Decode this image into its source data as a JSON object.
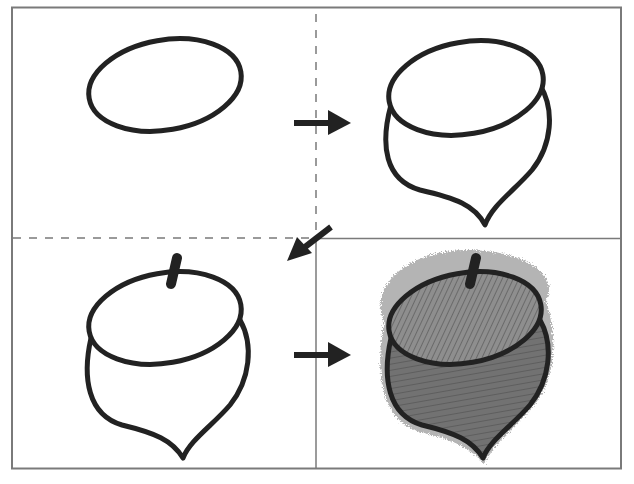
{
  "diagram": {
    "title": "How to draw an acorn",
    "layout": "2x2 grid",
    "colors": {
      "stroke": "#222222",
      "frame": "#7a7a7a",
      "cap_fill": "#8c8c8c",
      "body_fill": "#6e6e6e",
      "background": "#ffffff"
    },
    "panels": [
      {
        "step": 1,
        "label": "Step 1: draw an oval"
      },
      {
        "step": 2,
        "label": "Step 2: add the rounded body with a pointed tip"
      },
      {
        "step": 3,
        "label": "Step 3: add the stem on top"
      },
      {
        "step": 4,
        "label": "Step 4: shade the cap and body"
      }
    ],
    "arrows": [
      {
        "from": 1,
        "to": 2,
        "direction": "right"
      },
      {
        "from": 2,
        "to": 3,
        "direction": "down-left"
      },
      {
        "from": 3,
        "to": 4,
        "direction": "right"
      }
    ],
    "dividers": {
      "top_right_separator": "dashed",
      "top_left_bottom_separator": "dashed",
      "bottom_separator": "solid",
      "right_top_separator": "solid"
    }
  }
}
